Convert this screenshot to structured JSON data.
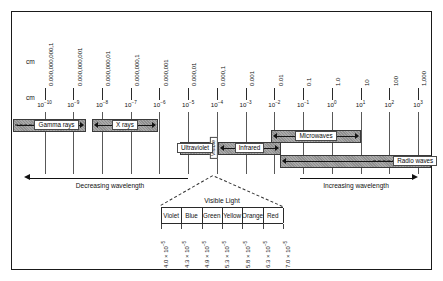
{
  "chart_data": {
    "type": "table",
    "unit_label_top": "cm",
    "unit_label_bottom": "cm",
    "axis_direction_left": "Decreasing wavelength",
    "axis_direction_right": "Increasing wavelength",
    "scale": {
      "decimal_labels": [
        "0.000,000,000,1",
        "0.000,000,001",
        "0.000,000,01",
        "0.000,000,1",
        "0.000,001",
        "0.000,01",
        "0.000,1",
        "0.001",
        "0.01",
        "0.1",
        "1.0",
        "10",
        "100",
        "1,000"
      ],
      "exponent_mantissa": "10",
      "exponents": [
        "-10",
        "-9",
        "-8",
        "-7",
        "-6",
        "-5",
        "-4",
        "-3",
        "-2",
        "-1",
        "0",
        "1",
        "2",
        "3"
      ]
    },
    "bands": [
      {
        "name": "Gamma rays",
        "start_exp": -11.1,
        "end_exp": -8.55,
        "row": 0,
        "arrow_left": false,
        "arrow_right": true,
        "dash_left": true
      },
      {
        "name": "X rays",
        "start_exp": -8.35,
        "end_exp": -6.05,
        "row": 0,
        "arrow_left": true,
        "arrow_right": true,
        "dash_left": false
      },
      {
        "name": "Ultraviolet",
        "start_exp": -5.3,
        "end_exp": -4.22,
        "row": 2,
        "arrow_left": true,
        "arrow_right": true,
        "dash_left": false
      },
      {
        "name": "Visible",
        "start_exp": -4.18,
        "end_exp": -4.0,
        "row": 2,
        "vertical": true
      },
      {
        "name": "Infrared",
        "start_exp": -3.95,
        "end_exp": -1.78,
        "row": 2,
        "arrow_left": true,
        "arrow_right": true,
        "dash_left": false
      },
      {
        "name": "Microwaves",
        "start_exp": -2.1,
        "end_exp": 1.0,
        "row": 1,
        "arrow_left": true,
        "arrow_right": true,
        "dash_left": false
      },
      {
        "name": "Radio waves",
        "start_exp": -1.82,
        "end_exp": 3.45,
        "row": 3,
        "arrow_left": true,
        "arrow_right": false,
        "dash_right": true
      }
    ],
    "visible_light": {
      "title": "Visible Light",
      "colors": [
        "Violet",
        "Blue",
        "Green",
        "Yellow",
        "Orange",
        "Red"
      ],
      "boundary_values": [
        "4.0 × 10",
        "4.3 × 10",
        "4.9 × 10",
        "5.3 × 10",
        "5.8 × 10",
        "6.3 × 10",
        "7.0 × 10"
      ],
      "boundary_exponent": "-5",
      "unit": "cm"
    }
  }
}
